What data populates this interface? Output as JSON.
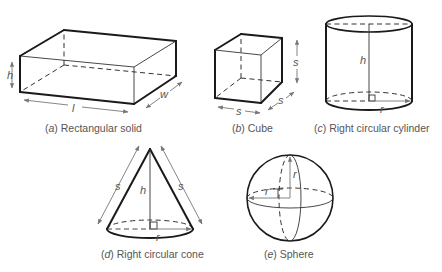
{
  "figure": {
    "panels": [
      {
        "id": "a",
        "letter": "a",
        "title": "Rectangular solid",
        "dimension_labels": {
          "height": "h",
          "length": "l",
          "width": "w"
        }
      },
      {
        "id": "b",
        "letter": "b",
        "title": "Cube",
        "dimension_labels": {
          "side_front": "s",
          "side_depth": "s",
          "side_height": "s"
        }
      },
      {
        "id": "c",
        "letter": "c",
        "title": "Right circular cylinder",
        "dimension_labels": {
          "height": "h",
          "radius": "r"
        }
      },
      {
        "id": "d",
        "letter": "d",
        "title": "Right circular cone",
        "dimension_labels": {
          "slant_left": "s",
          "slant_right": "s",
          "height": "h",
          "radius": "r"
        }
      },
      {
        "id": "e",
        "letter": "e",
        "title": "Sphere",
        "dimension_labels": {
          "radius_vertical": "r",
          "radius_horizontal": "r"
        }
      }
    ],
    "colors": {
      "edge": "#1a1a1a",
      "dimension": "#777777",
      "caption": "#555555"
    }
  }
}
